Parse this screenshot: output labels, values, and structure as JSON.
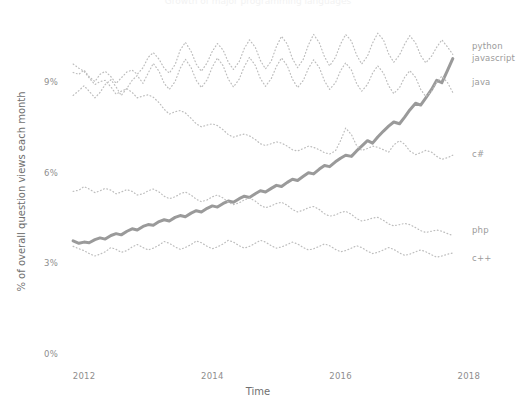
{
  "chart_data": {
    "type": "line",
    "title": "Growth of major programming languages",
    "xlabel": "Time",
    "ylabel": "% of overall question views each month",
    "xlim": [
      2011.75,
      2018.05
    ],
    "ylim": [
      0,
      10.9
    ],
    "grid": false,
    "legend_position": "right-inline-labels",
    "xticks": [
      2012,
      2014,
      2016,
      2018
    ],
    "xtick_labels": [
      "2012",
      "2014",
      "2016",
      "2018"
    ],
    "yticks": [
      0,
      3,
      6,
      9
    ],
    "ytick_labels": [
      "0%",
      "3%",
      "6%",
      "9%"
    ],
    "series": [
      {
        "name": "python",
        "label": "python",
        "style": "solid",
        "color": "#9a9a9a",
        "width": 3.0,
        "x": [
          2011.83,
          2011.92,
          2012.0,
          2012.08,
          2012.17,
          2012.25,
          2012.33,
          2012.42,
          2012.5,
          2012.58,
          2012.67,
          2012.75,
          2012.83,
          2012.92,
          2013.0,
          2013.08,
          2013.17,
          2013.25,
          2013.33,
          2013.42,
          2013.5,
          2013.58,
          2013.67,
          2013.75,
          2013.83,
          2013.92,
          2014.0,
          2014.08,
          2014.17,
          2014.25,
          2014.33,
          2014.42,
          2014.5,
          2014.58,
          2014.67,
          2014.75,
          2014.83,
          2014.92,
          2015.0,
          2015.08,
          2015.17,
          2015.25,
          2015.33,
          2015.42,
          2015.5,
          2015.58,
          2015.67,
          2015.75,
          2015.83,
          2015.92,
          2016.0,
          2016.08,
          2016.17,
          2016.25,
          2016.33,
          2016.42,
          2016.5,
          2016.58,
          2016.67,
          2016.75,
          2016.83,
          2016.92,
          2017.0,
          2017.08,
          2017.17,
          2017.25,
          2017.33,
          2017.42,
          2017.5,
          2017.58,
          2017.67,
          2017.75
        ],
        "y": [
          3.78,
          3.7,
          3.74,
          3.72,
          3.82,
          3.88,
          3.84,
          3.96,
          4.02,
          3.98,
          4.1,
          4.18,
          4.14,
          4.26,
          4.32,
          4.3,
          4.42,
          4.48,
          4.44,
          4.56,
          4.62,
          4.58,
          4.7,
          4.78,
          4.74,
          4.86,
          4.94,
          4.9,
          5.02,
          5.1,
          5.06,
          5.18,
          5.26,
          5.22,
          5.34,
          5.44,
          5.4,
          5.52,
          5.62,
          5.58,
          5.72,
          5.82,
          5.78,
          5.92,
          6.04,
          6.0,
          6.16,
          6.28,
          6.24,
          6.4,
          6.52,
          6.62,
          6.58,
          6.76,
          6.92,
          7.1,
          7.02,
          7.22,
          7.42,
          7.58,
          7.72,
          7.66,
          7.88,
          8.12,
          8.34,
          8.28,
          8.52,
          8.8,
          9.1,
          9.02,
          9.44,
          9.82
        ]
      },
      {
        "name": "javascript",
        "label": "javascript",
        "style": "dotted",
        "color": "#bdbdbd",
        "width": 1.2,
        "x": [
          2011.83,
          2011.92,
          2012.0,
          2012.08,
          2012.17,
          2012.25,
          2012.33,
          2012.42,
          2012.5,
          2012.58,
          2012.67,
          2012.75,
          2012.83,
          2012.92,
          2013.0,
          2013.08,
          2013.17,
          2013.25,
          2013.33,
          2013.42,
          2013.5,
          2013.58,
          2013.67,
          2013.75,
          2013.83,
          2013.92,
          2014.0,
          2014.08,
          2014.17,
          2014.25,
          2014.33,
          2014.42,
          2014.5,
          2014.58,
          2014.67,
          2014.75,
          2014.83,
          2014.92,
          2015.0,
          2015.08,
          2015.17,
          2015.25,
          2015.33,
          2015.42,
          2015.5,
          2015.58,
          2015.67,
          2015.75,
          2015.83,
          2015.92,
          2016.0,
          2016.08,
          2016.17,
          2016.25,
          2016.33,
          2016.42,
          2016.5,
          2016.58,
          2016.67,
          2016.75,
          2016.83,
          2016.92,
          2017.0,
          2017.08,
          2017.17,
          2017.25,
          2017.33,
          2017.42,
          2017.5,
          2017.58,
          2017.67,
          2017.75
        ],
        "y": [
          9.36,
          9.3,
          9.44,
          9.22,
          9.06,
          9.3,
          9.4,
          9.22,
          9.0,
          9.18,
          9.38,
          9.44,
          9.3,
          9.52,
          9.86,
          10.02,
          9.8,
          9.5,
          9.34,
          9.62,
          10.1,
          10.36,
          10.06,
          9.64,
          9.4,
          9.68,
          10.06,
          10.32,
          10.1,
          9.7,
          9.46,
          9.72,
          10.16,
          10.44,
          10.2,
          9.76,
          9.48,
          9.74,
          10.22,
          10.56,
          10.3,
          9.82,
          9.52,
          9.8,
          10.28,
          10.62,
          10.34,
          9.88,
          9.58,
          9.86,
          10.3,
          10.62,
          10.4,
          9.94,
          9.64,
          9.9,
          10.34,
          10.66,
          10.44,
          9.98,
          9.7,
          9.94,
          10.3,
          10.58,
          10.34,
          9.92,
          9.68,
          9.9,
          10.2,
          10.44,
          10.2,
          9.96
        ]
      },
      {
        "name": "java",
        "label": "java",
        "style": "dotted",
        "color": "#bdbdbd",
        "width": 1.2,
        "x": [
          2011.83,
          2011.92,
          2012.0,
          2012.08,
          2012.17,
          2012.25,
          2012.33,
          2012.42,
          2012.5,
          2012.58,
          2012.67,
          2012.75,
          2012.83,
          2012.92,
          2013.0,
          2013.08,
          2013.17,
          2013.25,
          2013.33,
          2013.42,
          2013.5,
          2013.58,
          2013.67,
          2013.75,
          2013.83,
          2013.92,
          2014.0,
          2014.08,
          2014.17,
          2014.25,
          2014.33,
          2014.42,
          2014.5,
          2014.58,
          2014.67,
          2014.75,
          2014.83,
          2014.92,
          2015.0,
          2015.08,
          2015.17,
          2015.25,
          2015.33,
          2015.42,
          2015.5,
          2015.58,
          2015.67,
          2015.75,
          2015.83,
          2015.92,
          2016.0,
          2016.08,
          2016.17,
          2016.25,
          2016.33,
          2016.42,
          2016.5,
          2016.58,
          2016.67,
          2016.75,
          2016.83,
          2016.92,
          2017.0,
          2017.08,
          2017.17,
          2017.25,
          2017.33,
          2017.42,
          2017.5,
          2017.58,
          2017.67,
          2017.75
        ],
        "y": [
          8.6,
          8.76,
          8.92,
          8.74,
          8.52,
          8.7,
          8.96,
          9.12,
          8.88,
          8.6,
          8.84,
          9.1,
          9.26,
          9.0,
          9.34,
          9.66,
          9.4,
          9.0,
          8.8,
          9.06,
          9.5,
          9.8,
          9.52,
          9.1,
          8.86,
          9.12,
          9.54,
          9.84,
          9.58,
          9.14,
          8.88,
          9.14,
          9.56,
          9.86,
          9.6,
          9.16,
          8.9,
          9.16,
          9.56,
          9.84,
          9.58,
          9.14,
          8.86,
          9.1,
          9.5,
          9.78,
          9.52,
          9.08,
          8.8,
          9.02,
          9.42,
          9.68,
          9.44,
          9.0,
          8.74,
          8.96,
          9.34,
          9.58,
          9.34,
          8.92,
          8.66,
          8.86,
          9.2,
          9.42,
          9.2,
          8.8,
          8.56,
          8.74,
          9.04,
          9.24,
          9.02,
          8.7
        ]
      },
      {
        "name": "c#",
        "label": "c#",
        "style": "dotted",
        "color": "#bdbdbd",
        "width": 1.2,
        "x": [
          2011.83,
          2011.92,
          2012.0,
          2012.08,
          2012.17,
          2012.25,
          2012.33,
          2012.42,
          2012.5,
          2012.58,
          2012.67,
          2012.75,
          2012.83,
          2012.92,
          2013.0,
          2013.08,
          2013.17,
          2013.25,
          2013.33,
          2013.42,
          2013.5,
          2013.58,
          2013.67,
          2013.75,
          2013.83,
          2013.92,
          2014.0,
          2014.08,
          2014.17,
          2014.25,
          2014.33,
          2014.42,
          2014.5,
          2014.58,
          2014.67,
          2014.75,
          2014.83,
          2014.92,
          2015.0,
          2015.08,
          2015.17,
          2015.25,
          2015.33,
          2015.42,
          2015.5,
          2015.58,
          2015.67,
          2015.75,
          2015.83,
          2015.92,
          2016.0,
          2016.08,
          2016.17,
          2016.25,
          2016.33,
          2016.42,
          2016.5,
          2016.58,
          2016.67,
          2016.75,
          2016.83,
          2016.92,
          2017.0,
          2017.08,
          2017.17,
          2017.25,
          2017.33,
          2017.42,
          2017.5,
          2017.58,
          2017.67,
          2017.75
        ],
        "y": [
          9.64,
          9.5,
          9.4,
          9.18,
          8.96,
          9.06,
          9.1,
          8.88,
          8.64,
          8.74,
          8.82,
          8.7,
          8.52,
          8.58,
          8.62,
          8.54,
          8.36,
          8.14,
          7.98,
          8.06,
          8.1,
          8.02,
          7.84,
          7.66,
          7.56,
          7.62,
          7.66,
          7.6,
          7.46,
          7.3,
          7.22,
          7.28,
          7.32,
          7.26,
          7.14,
          7.0,
          6.94,
          7.0,
          7.06,
          7.02,
          6.92,
          6.8,
          6.76,
          6.84,
          6.92,
          6.88,
          6.8,
          6.7,
          6.66,
          6.76,
          7.1,
          7.52,
          7.3,
          6.94,
          6.78,
          6.84,
          6.92,
          6.88,
          6.8,
          6.72,
          6.96,
          7.1,
          6.98,
          6.76,
          6.64,
          6.7,
          6.78,
          6.72,
          6.58,
          6.48,
          6.54,
          6.62
        ]
      },
      {
        "name": "php",
        "label": "php",
        "style": "dotted",
        "color": "#bdbdbd",
        "width": 1.2,
        "x": [
          2011.83,
          2011.92,
          2012.0,
          2012.08,
          2012.17,
          2012.25,
          2012.33,
          2012.42,
          2012.5,
          2012.58,
          2012.67,
          2012.75,
          2012.83,
          2012.92,
          2013.0,
          2013.08,
          2013.17,
          2013.25,
          2013.33,
          2013.42,
          2013.5,
          2013.58,
          2013.67,
          2013.75,
          2013.83,
          2013.92,
          2014.0,
          2014.08,
          2014.17,
          2014.25,
          2014.33,
          2014.42,
          2014.5,
          2014.58,
          2014.67,
          2014.75,
          2014.83,
          2014.92,
          2015.0,
          2015.08,
          2015.17,
          2015.25,
          2015.33,
          2015.42,
          2015.5,
          2015.58,
          2015.67,
          2015.75,
          2015.83,
          2015.92,
          2016.0,
          2016.08,
          2016.17,
          2016.25,
          2016.33,
          2016.42,
          2016.5,
          2016.58,
          2016.67,
          2016.75,
          2016.83,
          2016.92,
          2017.0,
          2017.08,
          2017.17,
          2017.25,
          2017.33,
          2017.42,
          2017.5,
          2017.58,
          2017.67,
          2017.75
        ],
        "y": [
          5.42,
          5.46,
          5.58,
          5.5,
          5.38,
          5.44,
          5.52,
          5.46,
          5.34,
          5.4,
          5.48,
          5.42,
          5.3,
          5.34,
          5.44,
          5.5,
          5.4,
          5.26,
          5.18,
          5.24,
          5.34,
          5.4,
          5.3,
          5.16,
          5.08,
          5.14,
          5.24,
          5.3,
          5.2,
          5.06,
          4.98,
          5.04,
          5.14,
          5.2,
          5.1,
          4.96,
          4.88,
          4.94,
          5.02,
          5.06,
          4.96,
          4.82,
          4.74,
          4.8,
          4.88,
          4.92,
          4.82,
          4.68,
          4.6,
          4.64,
          4.72,
          4.76,
          4.66,
          4.52,
          4.44,
          4.48,
          4.54,
          4.56,
          4.46,
          4.34,
          4.28,
          4.32,
          4.36,
          4.32,
          4.22,
          4.12,
          4.06,
          4.1,
          4.14,
          4.1,
          4.02,
          3.96
        ]
      },
      {
        "name": "c++",
        "label": "c++",
        "style": "dotted",
        "color": "#bdbdbd",
        "width": 1.2,
        "x": [
          2011.83,
          2011.92,
          2012.0,
          2012.08,
          2012.17,
          2012.25,
          2012.33,
          2012.42,
          2012.5,
          2012.58,
          2012.67,
          2012.75,
          2012.83,
          2012.92,
          2013.0,
          2013.08,
          2013.17,
          2013.25,
          2013.33,
          2013.42,
          2013.5,
          2013.58,
          2013.67,
          2013.75,
          2013.83,
          2013.92,
          2014.0,
          2014.08,
          2014.17,
          2014.25,
          2014.33,
          2014.42,
          2014.5,
          2014.58,
          2014.67,
          2014.75,
          2014.83,
          2014.92,
          2015.0,
          2015.08,
          2015.17,
          2015.25,
          2015.33,
          2015.42,
          2015.5,
          2015.58,
          2015.67,
          2015.75,
          2015.83,
          2015.92,
          2016.0,
          2016.08,
          2016.17,
          2016.25,
          2016.33,
          2016.42,
          2016.5,
          2016.58,
          2016.67,
          2016.75,
          2016.83,
          2016.92,
          2017.0,
          2017.08,
          2017.17,
          2017.25,
          2017.33,
          2017.42,
          2017.5,
          2017.58,
          2017.67,
          2017.75
        ],
        "y": [
          3.6,
          3.52,
          3.46,
          3.36,
          3.28,
          3.34,
          3.42,
          3.56,
          3.5,
          3.4,
          3.46,
          3.58,
          3.66,
          3.56,
          3.48,
          3.54,
          3.64,
          3.76,
          3.7,
          3.58,
          3.5,
          3.56,
          3.66,
          3.78,
          3.72,
          3.6,
          3.52,
          3.58,
          3.68,
          3.8,
          3.74,
          3.62,
          3.54,
          3.6,
          3.7,
          3.8,
          3.74,
          3.62,
          3.54,
          3.58,
          3.66,
          3.74,
          3.68,
          3.56,
          3.48,
          3.52,
          3.6,
          3.68,
          3.62,
          3.5,
          3.42,
          3.46,
          3.54,
          3.62,
          3.56,
          3.44,
          3.36,
          3.4,
          3.48,
          3.56,
          3.5,
          3.38,
          3.3,
          3.34,
          3.42,
          3.48,
          3.42,
          3.32,
          3.24,
          3.28,
          3.34,
          3.38
        ]
      }
    ],
    "annotations": [
      {
        "text": "python",
        "x": 2018.02,
        "y": 10.2
      },
      {
        "text": "javascript",
        "x": 2018.02,
        "y": 9.8
      },
      {
        "text": "java",
        "x": 2018.02,
        "y": 9.02
      },
      {
        "text": "c#",
        "x": 2018.02,
        "y": 6.62
      },
      {
        "text": "php",
        "x": 2018.02,
        "y": 4.1
      },
      {
        "text": "c++",
        "x": 2018.02,
        "y": 3.18
      }
    ]
  }
}
